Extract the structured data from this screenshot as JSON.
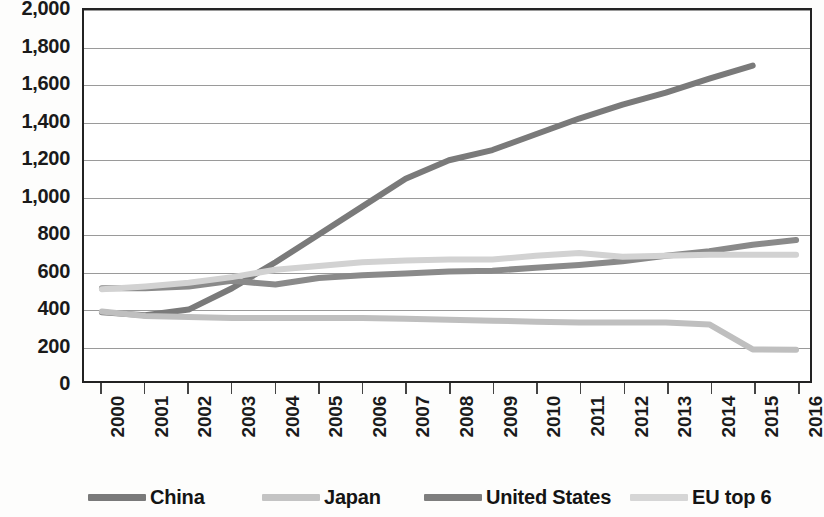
{
  "chart_data": {
    "type": "line",
    "title": "",
    "subtitle": "",
    "xlabel": "",
    "ylabel": "",
    "grid": true,
    "legend_position": "bottom",
    "xlim": [
      2000,
      2016
    ],
    "ylim": [
      0,
      2000
    ],
    "y_ticks": [
      0,
      200,
      400,
      600,
      800,
      1000,
      1200,
      1400,
      1600,
      1800,
      2000
    ],
    "y_tick_labels": [
      "0",
      "200",
      "400",
      "600",
      "800",
      "1,000",
      "1,200",
      "1,400",
      "1,600",
      "1,800",
      "2,000"
    ],
    "categories": [
      2000,
      2001,
      2002,
      2003,
      2004,
      2005,
      2006,
      2007,
      2008,
      2009,
      2010,
      2011,
      2012,
      2013,
      2014,
      2015,
      2016
    ],
    "x_tick_labels": [
      "2000",
      "2001",
      "2002",
      "2003",
      "2004",
      "2005",
      "2006",
      "2007",
      "2008",
      "2009",
      "2010",
      "2011",
      "2012",
      "2013",
      "2014",
      "2015",
      "2016"
    ],
    "series": [
      {
        "name": "China",
        "color": "#7a7a7a",
        "values": [
          370,
          355,
          385,
          500,
          640,
          790,
          940,
          1090,
          1190,
          1245,
          1330,
          1415,
          1490,
          1555,
          1630,
          1700,
          null
        ]
      },
      {
        "name": "Japan",
        "color": "#bfbfbf",
        "values": [
          375,
          350,
          345,
          340,
          340,
          340,
          340,
          335,
          330,
          325,
          320,
          315,
          315,
          315,
          305,
          170,
          168
        ]
      },
      {
        "name": "United States",
        "color": "#8a8a8a",
        "values": [
          500,
          500,
          510,
          540,
          520,
          555,
          570,
          580,
          590,
          595,
          610,
          625,
          645,
          675,
          700,
          735,
          760
        ]
      },
      {
        "name": "EU top 6",
        "color": "#d2d2d2",
        "values": [
          495,
          510,
          530,
          560,
          600,
          620,
          640,
          650,
          655,
          655,
          675,
          690,
          670,
          675,
          680,
          680,
          680
        ]
      }
    ]
  },
  "legend": {
    "items": [
      {
        "label": "China",
        "color": "#7a7a7a",
        "left": 88
      },
      {
        "label": "Japan",
        "color": "#c4c4c4",
        "left": 262
      },
      {
        "label": "United States",
        "color": "#7e7e7e",
        "left": 424
      },
      {
        "label": "EU top 6",
        "color": "#d6d6d6",
        "left": 630
      }
    ]
  }
}
